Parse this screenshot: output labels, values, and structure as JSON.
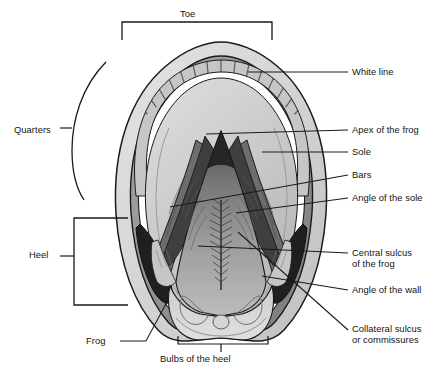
{
  "figure": {
    "type": "anatomical-diagram",
    "background_color": "#ffffff",
    "line_color": "#1a1a1a",
    "palette": {
      "outer_wall_light": "#d9d9d9",
      "wall_mid_gray": "#9a9a9a",
      "wall_dark_gray": "#7a7a7a",
      "white_line": "#ffffff",
      "laminae_hatch": "#6e6e6e",
      "sole_light": "#d2d2d2",
      "sole_mid": "#bdbdbd",
      "frog_gray": "#9c9c9c",
      "bar_dark": "#6a6a6a",
      "angle_wall_black": "#2b2b2b",
      "bulb_light": "#cfcfcf"
    }
  },
  "labels": {
    "toe": "Toe",
    "quarters": "Quarters",
    "heel": "Heel",
    "frog": "Frog",
    "bulbs_of_the_heel": "Bulbs of the heel",
    "white_line": "White line",
    "apex_of_the_frog": "Apex of the frog",
    "sole": "Sole",
    "bars": "Bars",
    "angle_of_the_sole": "Angle of the sole",
    "central_sulcus_line1": "Central sulcus",
    "central_sulcus_line2": "of the frog",
    "angle_of_the_wall": "Angle of the wall",
    "collateral_sulcus_line1": "Collateral sulcus",
    "collateral_sulcus_line2": "or commissures"
  },
  "label_positions": {
    "toe": {
      "x": 180,
      "y": 8
    },
    "quarters": {
      "x": 14,
      "y": 124
    },
    "heel": {
      "x": 29,
      "y": 255
    },
    "frog": {
      "x": 86,
      "y": 340
    },
    "bulbs_of_the_heel": {
      "x": 160,
      "y": 356
    },
    "white_line": {
      "x": 352,
      "y": 66
    },
    "apex_of_the_frog": {
      "x": 352,
      "y": 124
    },
    "sole": {
      "x": 352,
      "y": 147
    },
    "bars": {
      "x": 352,
      "y": 170
    },
    "angle_of_the_sole": {
      "x": 352,
      "y": 193
    },
    "central_sulcus": {
      "x": 352,
      "y": 248
    },
    "angle_of_the_wall": {
      "x": 352,
      "y": 285
    },
    "collateral_sulcus": {
      "x": 352,
      "y": 324
    }
  },
  "brackets": {
    "toe": {
      "left": 122,
      "right": 272,
      "top": 22,
      "drop": 18
    },
    "quarters": {
      "type": "arc",
      "x": 72,
      "top": 62,
      "bottom": 196
    },
    "heel": {
      "x": 74,
      "top": 218,
      "bottom": 305,
      "tick_y": 256
    },
    "bulbs_of_the_heel": {
      "left": 178,
      "right": 268,
      "y": 344,
      "tick_x": 221
    }
  },
  "leaders": [
    {
      "name": "white-line",
      "from": [
        348,
        72
      ],
      "to": [
        248,
        72
      ]
    },
    {
      "name": "apex-of-the-frog",
      "from": [
        348,
        130
      ],
      "to": [
        206,
        134
      ]
    },
    {
      "name": "sole",
      "from": [
        348,
        152
      ],
      "to": [
        262,
        152
      ]
    },
    {
      "name": "bars",
      "from": [
        348,
        175
      ],
      "to": [
        170,
        207
      ]
    },
    {
      "name": "angle-of-the-sole",
      "from": [
        348,
        198
      ],
      "to": [
        236,
        213
      ]
    },
    {
      "name": "central-sulcus-of-the-frog",
      "from": [
        348,
        253
      ],
      "to": [
        198,
        246
      ]
    },
    {
      "name": "angle-of-the-wall",
      "from": [
        348,
        290
      ],
      "to": [
        262,
        276
      ]
    },
    {
      "name": "collateral-sulcus-or-commissures",
      "from": [
        348,
        330
      ],
      "to": [
        238,
        232
      ]
    },
    {
      "name": "frog",
      "from": [
        120,
        341
      ],
      "to": [
        168,
        300
      ]
    },
    {
      "name": "quarters",
      "from": [
        60,
        128
      ],
      "to": [
        72,
        128
      ]
    },
    {
      "name": "heel",
      "from": [
        60,
        256
      ],
      "to": [
        74,
        256
      ]
    }
  ]
}
